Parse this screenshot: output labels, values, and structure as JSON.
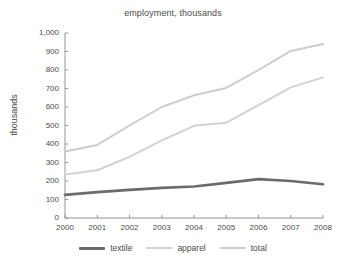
{
  "chart_data": {
    "type": "line",
    "title": "employment, thousands",
    "xlabel": "",
    "ylabel": "thousands",
    "x": [
      "2000",
      "2001",
      "2002",
      "2003",
      "2004",
      "2005",
      "2006",
      "2007",
      "2008"
    ],
    "categories": [
      "2000",
      "2001",
      "2002",
      "2003",
      "2004",
      "2005",
      "2006",
      "2007",
      "2008"
    ],
    "xlim": [
      2000,
      2008
    ],
    "ylim": [
      0,
      1000
    ],
    "yticks": [
      0,
      100,
      200,
      300,
      400,
      500,
      600,
      700,
      800,
      900,
      1000
    ],
    "ytick_labels": [
      "0",
      "100",
      "200",
      "300",
      "400",
      "500",
      "600",
      "700",
      "800",
      "900",
      "1,000"
    ],
    "xtick_labels": [
      "2000",
      "2001",
      "2002",
      "2003",
      "2004",
      "2005",
      "2006",
      "2007",
      "2008"
    ],
    "grid": false,
    "legend_position": "bottom",
    "series": [
      {
        "name": "textile",
        "color": "#6b6b6b",
        "values": [
          125,
          140,
          152,
          163,
          170,
          190,
          210,
          200,
          182
        ]
      },
      {
        "name": "apparel",
        "color": "#d2d2d2",
        "values": [
          235,
          258,
          330,
          420,
          498,
          515,
          610,
          706,
          760
        ]
      },
      {
        "name": "total",
        "color": "#cccccc",
        "values": [
          360,
          395,
          500,
          600,
          663,
          703,
          800,
          903,
          940
        ]
      }
    ]
  },
  "legend": {
    "items": [
      {
        "label": "textile",
        "color": "#6b6b6b"
      },
      {
        "label": "apparel",
        "color": "#d2d2d2"
      },
      {
        "label": "total",
        "color": "#cccccc"
      }
    ]
  },
  "axis": {
    "color": "#8a8a8a"
  }
}
